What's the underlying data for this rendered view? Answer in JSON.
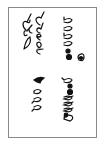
{
  "figure": {
    "border_color": "#8a8a8a",
    "ink_color": "#111111",
    "columns": [
      {
        "id": "right-top",
        "glyphs": [
          "p",
          "o",
          "p",
          "o",
          "dot",
          "dot",
          "e"
        ]
      },
      {
        "id": "left-top",
        "glyphs": [
          "d",
          "d",
          "l",
          "g",
          "g",
          "g",
          "o",
          "a"
        ]
      },
      {
        "id": "right-bottom",
        "glyphs": [
          "p",
          "dot",
          "dot",
          "d",
          "d",
          "d",
          "a"
        ]
      },
      {
        "id": "left-bottom",
        "glyphs": [
          "swash",
          "o",
          "p",
          "p"
        ]
      }
    ]
  }
}
